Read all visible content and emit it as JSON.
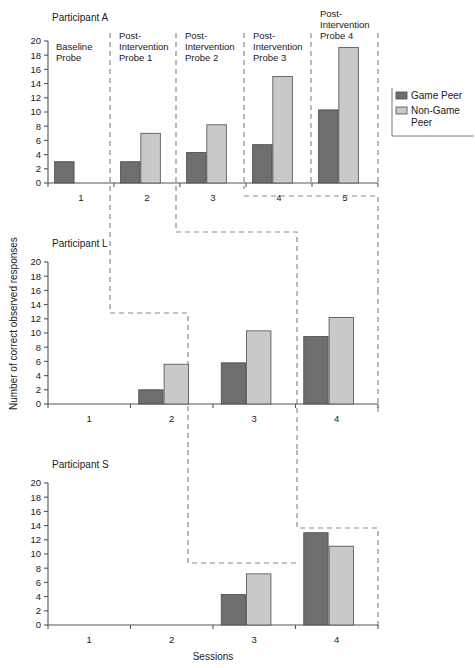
{
  "figure": {
    "xlabel": "Sessions",
    "ylabel": "Number of correct observed responses"
  },
  "legend": {
    "items": [
      {
        "label": "Game Peer",
        "color": "#6e6e6e"
      },
      {
        "label": "Non-Game Peer",
        "color": "#c9c9c9"
      }
    ]
  },
  "colors": {
    "game_peer": "#6e6e6e",
    "non_game_peer": "#c9c9c9",
    "axis": "#555555",
    "phase_line": "#8a8a8a",
    "background": "#ffffff"
  },
  "chart_data": {
    "type": "bar",
    "title": "",
    "xlabel": "Sessions",
    "ylabel": "Number of correct observed responses",
    "ylim": [
      0,
      20
    ],
    "ytick_labels": [
      "0",
      "2",
      "4",
      "6",
      "8",
      "10",
      "12",
      "14",
      "16",
      "18",
      "20"
    ],
    "yticks": [
      0,
      2,
      4,
      6,
      8,
      10,
      12,
      14,
      16,
      18,
      20
    ],
    "grid": false,
    "legend_position": "right",
    "series_names": [
      "Game Peer",
      "Non-Game Peer"
    ],
    "panels": [
      {
        "name": "Participant A",
        "categories": [
          "1",
          "2",
          "3",
          "4",
          "5"
        ],
        "phase_labels": [
          "Baseline Probe",
          "Post-Intervention Probe 1",
          "Post-Intervention Probe 2",
          "Post-Intervention Probe 3",
          "Post-Intervention Probe 4"
        ],
        "series": [
          {
            "name": "Game Peer",
            "values": [
              3,
              3,
              4.3,
              5.4,
              10.3
            ]
          },
          {
            "name": "Non-Game Peer",
            "values": [
              null,
              7,
              8.2,
              15,
              19.1
            ]
          }
        ]
      },
      {
        "name": "Participant L",
        "categories": [
          "1",
          "2",
          "3",
          "4"
        ],
        "phase_labels": [],
        "series": [
          {
            "name": "Game Peer",
            "values": [
              null,
              2,
              5.8,
              9.5
            ]
          },
          {
            "name": "Non-Game Peer",
            "values": [
              null,
              5.6,
              10.3,
              12.2
            ]
          }
        ]
      },
      {
        "name": "Participant S",
        "categories": [
          "1",
          "2",
          "3",
          "4"
        ],
        "phase_labels": [],
        "series": [
          {
            "name": "Game Peer",
            "values": [
              null,
              null,
              4.3,
              13
            ]
          },
          {
            "name": "Non-Game Peer",
            "values": [
              null,
              null,
              7.2,
              11.1
            ]
          }
        ]
      }
    ]
  }
}
